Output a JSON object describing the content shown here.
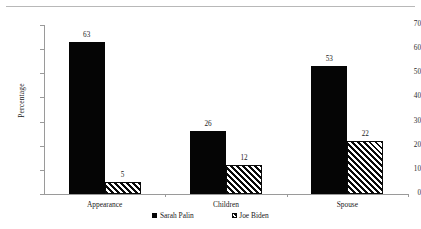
{
  "chart_data": {
    "type": "bar",
    "title": "",
    "subtitle": "",
    "xlabel": "",
    "ylabel": "Percentage",
    "ylim": [
      0,
      70
    ],
    "ytick_step": 10,
    "yticks": [
      0,
      10,
      20,
      30,
      40,
      50,
      60,
      70
    ],
    "ytick_labels": [
      "0",
      "10",
      "20",
      "30",
      "40",
      "50",
      "60",
      "70"
    ],
    "categories": [
      "Appearance",
      "Children",
      "Spouse"
    ],
    "series": [
      {
        "name": "Sarah Palin",
        "values": [
          63,
          26,
          53
        ],
        "value_labels": [
          "63",
          "26",
          "53"
        ],
        "fill": "solid-black",
        "color": "#050505"
      },
      {
        "name": "Joe Biden",
        "values": [
          5,
          12,
          22
        ],
        "value_labels": [
          "5",
          "12",
          "22"
        ],
        "fill": "diagonal-hatch",
        "color": "#ffffff"
      }
    ],
    "grid": false,
    "legend_position": "bottom",
    "data_labels": true,
    "axis_color": "#9a9a9a"
  },
  "legend": {
    "items": [
      {
        "label": "Sarah Palin",
        "swatch": "solid-square-icon"
      },
      {
        "label": "Joe Biden",
        "swatch": "hatched-square-icon"
      }
    ]
  }
}
